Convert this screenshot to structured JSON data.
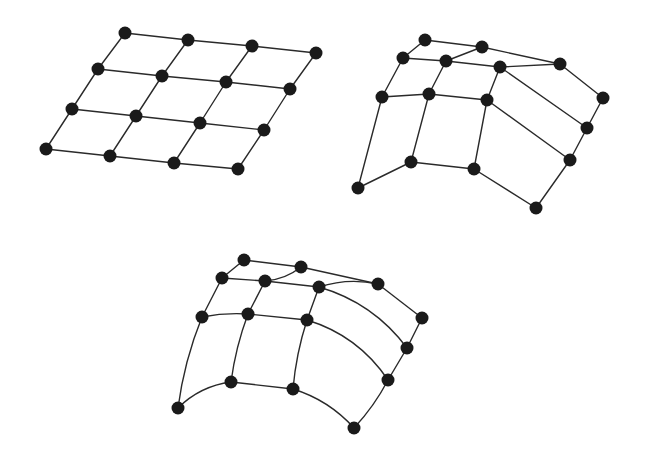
{
  "diagram": {
    "background": "#ffffff",
    "edge_color": "#2a2a2a",
    "node_color": "#1a1a1a",
    "node_radius": 6.5,
    "meshes": [
      {
        "id": "flat-grid",
        "label": "Flat 4x4 grid mesh",
        "curved": false,
        "nodes": {
          "r0c0": [
            125,
            33
          ],
          "r0c1": [
            188,
            40
          ],
          "r0c2": [
            252,
            46
          ],
          "r0c3": [
            316,
            53
          ],
          "r1c0": [
            98,
            69
          ],
          "r1c1": [
            162,
            76
          ],
          "r1c2": [
            226,
            82
          ],
          "r1c3": [
            290,
            89
          ],
          "r2c0": [
            72,
            109
          ],
          "r2c1": [
            136,
            116
          ],
          "r2c2": [
            200,
            123
          ],
          "r2c3": [
            264,
            130
          ],
          "r3c0": [
            46,
            149
          ],
          "r3c1": [
            110,
            156
          ],
          "r3c2": [
            174,
            163
          ],
          "r3c3": [
            238,
            169
          ]
        },
        "edges": [
          [
            "r0c0",
            "r0c1"
          ],
          [
            "r0c1",
            "r0c2"
          ],
          [
            "r0c2",
            "r0c3"
          ],
          [
            "r1c0",
            "r1c1"
          ],
          [
            "r1c1",
            "r1c2"
          ],
          [
            "r1c2",
            "r1c3"
          ],
          [
            "r2c0",
            "r2c1"
          ],
          [
            "r2c1",
            "r2c2"
          ],
          [
            "r2c2",
            "r2c3"
          ],
          [
            "r3c0",
            "r3c1"
          ],
          [
            "r3c1",
            "r3c2"
          ],
          [
            "r3c2",
            "r3c3"
          ],
          [
            "r0c0",
            "r1c0"
          ],
          [
            "r1c0",
            "r2c0"
          ],
          [
            "r2c0",
            "r3c0"
          ],
          [
            "r0c1",
            "r1c1"
          ],
          [
            "r1c1",
            "r2c1"
          ],
          [
            "r2c1",
            "r3c1"
          ],
          [
            "r0c2",
            "r1c2"
          ],
          [
            "r1c2",
            "r2c2"
          ],
          [
            "r2c2",
            "r3c2"
          ],
          [
            "r0c3",
            "r1c3"
          ],
          [
            "r1c3",
            "r2c3"
          ],
          [
            "r2c3",
            "r3c3"
          ]
        ]
      },
      {
        "id": "deformed-grid-straight",
        "label": "Deformed grid mesh with straight edges",
        "curved": false,
        "nodes": {
          "A": [
            425,
            40
          ],
          "B": [
            482,
            47
          ],
          "C": [
            560,
            64
          ],
          "D": [
            403,
            58
          ],
          "E": [
            446,
            61
          ],
          "F": [
            500,
            67
          ],
          "G": [
            382,
            97
          ],
          "H": [
            429,
            94
          ],
          "I": [
            487,
            100
          ],
          "J": [
            603,
            98
          ],
          "K": [
            587,
            128
          ],
          "L": [
            411,
            162
          ],
          "M": [
            474,
            169
          ],
          "N": [
            570,
            160
          ],
          "O": [
            358,
            188
          ],
          "P": [
            536,
            208
          ]
        },
        "edges": [
          [
            "A",
            "B"
          ],
          [
            "A",
            "D"
          ],
          [
            "B",
            "E"
          ],
          [
            "B",
            "C"
          ],
          [
            "D",
            "E"
          ],
          [
            "E",
            "F"
          ],
          [
            "F",
            "C"
          ],
          [
            "D",
            "G"
          ],
          [
            "E",
            "H"
          ],
          [
            "F",
            "I"
          ],
          [
            "G",
            "H"
          ],
          [
            "H",
            "I"
          ],
          [
            "C",
            "J"
          ],
          [
            "J",
            "K"
          ],
          [
            "F",
            "K"
          ],
          [
            "I",
            "N"
          ],
          [
            "K",
            "N"
          ],
          [
            "G",
            "O"
          ],
          [
            "H",
            "L"
          ],
          [
            "I",
            "M"
          ],
          [
            "O",
            "L"
          ],
          [
            "L",
            "M"
          ],
          [
            "M",
            "P"
          ],
          [
            "N",
            "P"
          ]
        ]
      },
      {
        "id": "deformed-grid-curved",
        "label": "Deformed grid mesh with curved edges",
        "curved": true,
        "nodes": {
          "A": [
            244,
            260
          ],
          "B": [
            301,
            267
          ],
          "C": [
            378,
            284
          ],
          "D": [
            222,
            278
          ],
          "E": [
            265,
            281
          ],
          "F": [
            319,
            287
          ],
          "G": [
            202,
            317
          ],
          "H": [
            248,
            314
          ],
          "I": [
            307,
            320
          ],
          "J": [
            422,
            318
          ],
          "K": [
            407,
            348
          ],
          "L": [
            231,
            382
          ],
          "M": [
            293,
            389
          ],
          "N": [
            388,
            380
          ],
          "O": [
            178,
            408
          ],
          "P": [
            354,
            428
          ]
        },
        "edges": [
          [
            "A",
            "B",
            0
          ],
          [
            "A",
            "D",
            0
          ],
          [
            "B",
            "E",
            -6
          ],
          [
            "B",
            "C",
            0
          ],
          [
            "D",
            "E",
            0
          ],
          [
            "E",
            "F",
            0
          ],
          [
            "F",
            "C",
            -8
          ],
          [
            "D",
            "G",
            0
          ],
          [
            "E",
            "H",
            0
          ],
          [
            "F",
            "I",
            0
          ],
          [
            "G",
            "H",
            -3
          ],
          [
            "H",
            "I",
            0
          ],
          [
            "C",
            "J",
            0
          ],
          [
            "J",
            "K",
            0
          ],
          [
            "F",
            "K",
            -18
          ],
          [
            "I",
            "N",
            -18
          ],
          [
            "K",
            "N",
            0
          ],
          [
            "G",
            "O",
            6
          ],
          [
            "H",
            "L",
            4
          ],
          [
            "I",
            "M",
            4
          ],
          [
            "O",
            "L",
            -10
          ],
          [
            "L",
            "M",
            0
          ],
          [
            "M",
            "P",
            -10
          ],
          [
            "N",
            "P",
            -4
          ]
        ]
      }
    ]
  }
}
